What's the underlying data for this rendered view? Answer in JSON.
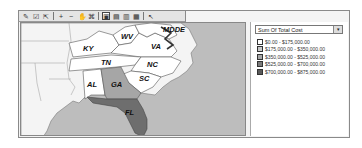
{
  "toolbar": {
    "buttons": [
      {
        "name": "edit-map-icon",
        "glyph": "✎"
      },
      {
        "name": "properties-icon",
        "glyph": "☑"
      },
      {
        "name": "export-icon",
        "glyph": "⇱"
      },
      {
        "name": "zoom-in-icon",
        "glyph": "+"
      },
      {
        "name": "zoom-out-icon",
        "glyph": "−"
      },
      {
        "name": "pan-icon",
        "glyph": "✋"
      },
      {
        "name": "full-extent-icon",
        "glyph": "⌘"
      },
      {
        "name": "layout-1-icon",
        "glyph": "▣"
      },
      {
        "name": "layout-2-icon",
        "glyph": "▤"
      },
      {
        "name": "layout-3-icon",
        "glyph": "▥"
      },
      {
        "name": "layout-4-icon",
        "glyph": "▦"
      },
      {
        "name": "select-icon",
        "glyph": "↖"
      }
    ]
  },
  "map": {
    "states": [
      {
        "abbr": "KY",
        "color": "#ffffff"
      },
      {
        "abbr": "WV",
        "color": "#ffffff"
      },
      {
        "abbr": "VA",
        "color": "#ffffff"
      },
      {
        "abbr": "MD",
        "color": "#ffffff"
      },
      {
        "abbr": "DE",
        "color": "#ffffff"
      },
      {
        "abbr": "TN",
        "color": "#ffffff"
      },
      {
        "abbr": "NC",
        "color": "#ffffff"
      },
      {
        "abbr": "SC",
        "color": "#ffffff"
      },
      {
        "abbr": "AL",
        "color": "#ffffff"
      },
      {
        "abbr": "GA",
        "color": "#a6a6a6"
      },
      {
        "abbr": "FL",
        "color": "#6e6e6e"
      }
    ]
  },
  "legend": {
    "field": "Sum Of Total Cost",
    "dropdown_arrow": "▾",
    "items": [
      {
        "label": "$0.00 - $175,000.00",
        "color": "#ffffff"
      },
      {
        "label": "$175,000.00 - $350,000.00",
        "color": "#c8c8c8"
      },
      {
        "label": "$350,000.00 - $525,000.00",
        "color": "#a6a6a6"
      },
      {
        "label": "$525,000.00 - $700,000.00",
        "color": "#7a7a7a"
      },
      {
        "label": "$700,000.00 - $875,000.00",
        "color": "#5a5a5a"
      }
    ]
  }
}
